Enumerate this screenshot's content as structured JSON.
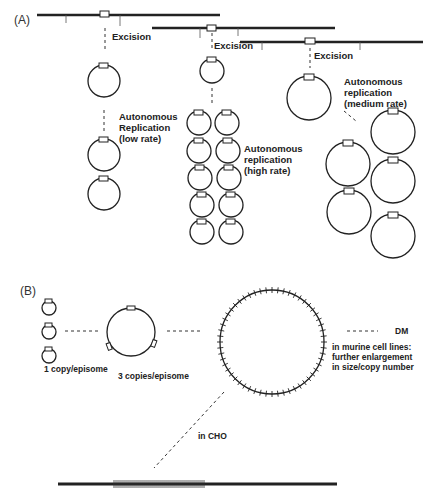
{
  "panels": {
    "a": {
      "label": "(A)",
      "excision_label": "Excision",
      "low": {
        "line1": "Autonomous",
        "line2": "Replication",
        "line3": "(low rate)"
      },
      "high": {
        "line1": "Autonomous",
        "line2": "replication",
        "line3": "(high rate)"
      },
      "medium": {
        "line1": "Autonomous",
        "line2": "replication",
        "line3": "(medium rate)"
      }
    },
    "b": {
      "label": "(B)",
      "one_copy": "1 copy/episome",
      "three_copies": "3 copies/episome",
      "dm": "DM",
      "murine": {
        "line1": "in murine cell lines:",
        "line2": "further enlargement",
        "line3": "in size/copy number"
      },
      "cho": "in CHO"
    }
  },
  "colors": {
    "ink": "#222222",
    "background": "#ffffff"
  }
}
